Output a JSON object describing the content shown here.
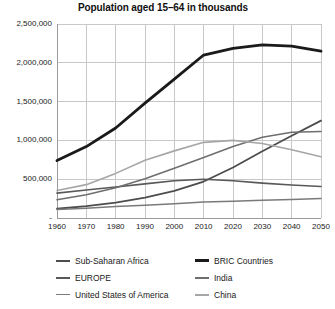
{
  "chart_data": {
    "type": "line",
    "title": "Population aged 15–64 in thousands",
    "xlabel": "",
    "ylabel": "",
    "x": [
      1960,
      1970,
      1980,
      1990,
      2000,
      2010,
      2020,
      2030,
      2040,
      2050
    ],
    "xlim": [
      1960,
      2050
    ],
    "ylim": [
      0,
      2500000
    ],
    "yticks": [
      0,
      500000,
      1000000,
      1500000,
      2000000,
      2500000
    ],
    "ytick_labels": [
      "-",
      "500,000",
      "1,000,000",
      "1,500,000",
      "2,000,000",
      "2,500,000"
    ],
    "xtick_labels": [
      "1960",
      "1970",
      "1980",
      "1990",
      "2000",
      "2010",
      "2020",
      "2030",
      "2040",
      "2050"
    ],
    "grid": true,
    "legend_position": "bottom",
    "series": [
      {
        "name": "Sub-Saharan Africa",
        "color": "#4d4d4d",
        "width": 1.8,
        "values": [
          119000,
          152000,
          198000,
          262000,
          350000,
          470000,
          650000,
          860000,
          1060000,
          1255000
        ]
      },
      {
        "name": "BRIC Countries",
        "color": "#1a1a1a",
        "width": 2.8,
        "values": [
          740000,
          920000,
          1160000,
          1480000,
          1790000,
          2100000,
          2185000,
          2230000,
          2215000,
          2150000
        ]
      },
      {
        "name": "EUROPE",
        "color": "#595959",
        "width": 1.6,
        "values": [
          320000,
          360000,
          400000,
          440000,
          480000,
          500000,
          480000,
          450000,
          425000,
          405000
        ]
      },
      {
        "name": "India",
        "color": "#6e6e6e",
        "width": 1.6,
        "values": [
          235000,
          300000,
          390000,
          505000,
          640000,
          780000,
          920000,
          1040000,
          1105000,
          1115000
        ]
      },
      {
        "name": "United States of America",
        "color": "#7a7a7a",
        "width": 1.5,
        "values": [
          110000,
          125000,
          148000,
          165000,
          185000,
          205000,
          215000,
          228000,
          240000,
          250000
        ]
      },
      {
        "name": "China",
        "color": "#a6a6a6",
        "width": 1.6,
        "values": [
          355000,
          430000,
          575000,
          745000,
          865000,
          975000,
          1000000,
          960000,
          880000,
          790000
        ]
      }
    ]
  },
  "legend": {
    "columns": [
      [
        {
          "label": "Sub-Saharan Africa",
          "color": "#4d4d4d",
          "width": 2.2
        },
        {
          "label": "EUROPE",
          "color": "#595959",
          "width": 2.0
        },
        {
          "label": "United States of America",
          "color": "#7a7a7a",
          "width": 1.8
        }
      ],
      [
        {
          "label": "BRIC Countries",
          "color": "#1a1a1a",
          "width": 3.0
        },
        {
          "label": "India",
          "color": "#6e6e6e",
          "width": 2.0
        },
        {
          "label": "China",
          "color": "#a6a6a6",
          "width": 2.0
        }
      ]
    ]
  },
  "style": {
    "grid_color": "#c8c8c8",
    "axis_color": "#9a9a9a",
    "background": "#ffffff",
    "text_color": "#1a1a1a"
  }
}
